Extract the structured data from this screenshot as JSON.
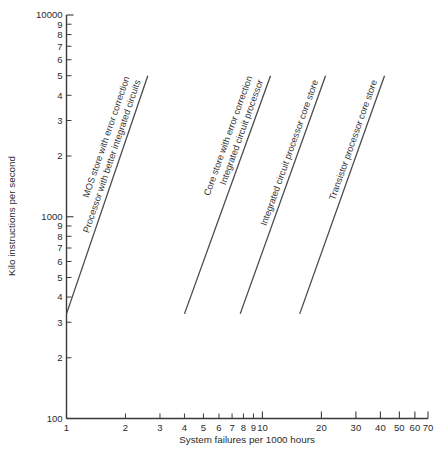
{
  "chart_data": {
    "type": "line",
    "title": "",
    "xlabel": "System failures per 1000 hours",
    "ylabel": "Kilo instructions per second",
    "xscale": "log",
    "yscale": "log",
    "xlim": [
      1,
      70
    ],
    "ylim": [
      100,
      10000
    ],
    "grid": false,
    "legend_position": "inline-along-lines",
    "x_ticks": [
      {
        "value": 1,
        "label": "1"
      },
      {
        "value": 2,
        "label": "2"
      },
      {
        "value": 3,
        "label": "3"
      },
      {
        "value": 4,
        "label": "4"
      },
      {
        "value": 5,
        "label": "5"
      },
      {
        "value": 6,
        "label": "6"
      },
      {
        "value": 7,
        "label": "7"
      },
      {
        "value": 8,
        "label": "8"
      },
      {
        "value": 9,
        "label": "9"
      },
      {
        "value": 10,
        "label": "10"
      },
      {
        "value": 20,
        "label": "20"
      },
      {
        "value": 30,
        "label": "30"
      },
      {
        "value": 40,
        "label": "40"
      },
      {
        "value": 50,
        "label": "50"
      },
      {
        "value": 60,
        "label": "60"
      },
      {
        "value": 70,
        "label": "70"
      }
    ],
    "y_ticks": [
      {
        "value": 10000,
        "label": "10000"
      },
      {
        "value": 9000,
        "label": "9"
      },
      {
        "value": 8000,
        "label": "8"
      },
      {
        "value": 7000,
        "label": "7"
      },
      {
        "value": 6000,
        "label": "6"
      },
      {
        "value": 5000,
        "label": "5"
      },
      {
        "value": 4000,
        "label": "4"
      },
      {
        "value": 3000,
        "label": "3"
      },
      {
        "value": 2000,
        "label": "2"
      },
      {
        "value": 1000,
        "label": "1000"
      },
      {
        "value": 900,
        "label": "9"
      },
      {
        "value": 800,
        "label": "8"
      },
      {
        "value": 700,
        "label": "7"
      },
      {
        "value": 600,
        "label": "6"
      },
      {
        "value": 500,
        "label": "5"
      },
      {
        "value": 400,
        "label": "4"
      },
      {
        "value": 300,
        "label": "3"
      },
      {
        "value": 200,
        "label": "2"
      },
      {
        "value": 100,
        "label": "100"
      }
    ],
    "series": [
      {
        "name": "Processor with better integrated circuits / MOS store with error correction",
        "label_lines": [
          "Processor with better integrated circuits",
          "MOS store with error correction"
        ],
        "points": [
          {
            "x": 1.0,
            "y": 330
          },
          {
            "x": 2.6,
            "y": 5000
          }
        ]
      },
      {
        "name": "Integrated circuit processor / Core store with error correction",
        "label_lines": [
          "Integrated circuit processor",
          "Core store with error correction"
        ],
        "points": [
          {
            "x": 4.0,
            "y": 330
          },
          {
            "x": 11.0,
            "y": 5000
          }
        ]
      },
      {
        "name": "Integrated circuit processor core store",
        "label_lines": [
          "Integrated circuit processor core store"
        ],
        "points": [
          {
            "x": 7.7,
            "y": 330
          },
          {
            "x": 21.0,
            "y": 5000
          }
        ]
      },
      {
        "name": "Transistor processor core store",
        "label_lines": [
          "Transistor processor core store"
        ],
        "points": [
          {
            "x": 15.5,
            "y": 330
          },
          {
            "x": 42.0,
            "y": 5000
          }
        ]
      }
    ],
    "caption": ""
  }
}
